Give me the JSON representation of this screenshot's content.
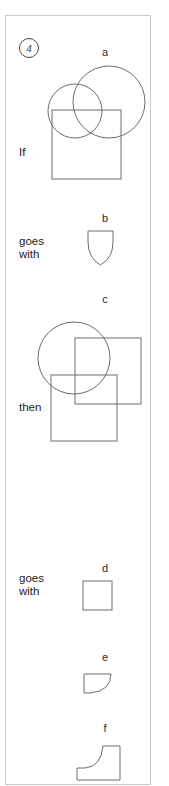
{
  "puzzle": {
    "item_number": "4",
    "relations": [
      {
        "id": "if",
        "text": "If"
      },
      {
        "id": "goes-with-1",
        "text": "goes\nwith"
      },
      {
        "id": "then",
        "text": "then"
      },
      {
        "id": "goes-with-2",
        "text": "goes\nwith"
      }
    ],
    "figures": [
      {
        "id": "a",
        "label": "a",
        "shapes": "large-circle, small-circle, square",
        "role": "premise-source"
      },
      {
        "id": "b",
        "label": "b",
        "shapes": "shield",
        "role": "premise-target"
      },
      {
        "id": "c",
        "label": "c",
        "shapes": "circle, square, square",
        "role": "question-source"
      },
      {
        "id": "d",
        "label": "d",
        "shapes": "square",
        "role": "option"
      },
      {
        "id": "e",
        "label": "e",
        "shapes": "quarter-round-quadrilateral",
        "role": "option"
      },
      {
        "id": "f",
        "label": "f",
        "shapes": "concave-boot",
        "role": "option"
      }
    ],
    "colors": {
      "stroke": "#6d6d6d",
      "border": "#c9c9c9",
      "text": "#1c1c1c",
      "background": "#ffffff"
    }
  }
}
